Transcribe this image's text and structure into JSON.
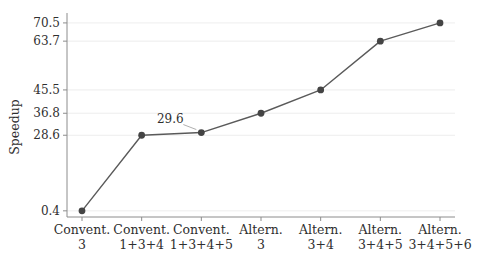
{
  "chart_data": {
    "type": "line",
    "title": "",
    "xlabel": "",
    "ylabel": "Speedup",
    "categories": [
      {
        "line1": "Convent.",
        "line2": "3"
      },
      {
        "line1": "Convent.",
        "line2": "1+3+4"
      },
      {
        "line1": "Convent.",
        "line2": "1+3+4+5"
      },
      {
        "line1": "Altern.",
        "line2": "3"
      },
      {
        "line1": "Altern.",
        "line2": "3+4"
      },
      {
        "line1": "Altern.",
        "line2": "3+4+5"
      },
      {
        "line1": "Altern.",
        "line2": "3+4+5+6"
      }
    ],
    "series": [
      {
        "name": "Speedup",
        "values": [
          0.4,
          28.6,
          29.6,
          36.8,
          45.5,
          63.7,
          70.5
        ]
      }
    ],
    "y_ticks": [
      0.4,
      28.6,
      36.8,
      45.5,
      63.7,
      70.5
    ],
    "y_tick_labels": [
      "0.4",
      "28.6",
      "36.8",
      "45.5",
      "63.7",
      "70.5"
    ],
    "ylim": [
      -1.9,
      74.2
    ],
    "grid": "horizontal",
    "legend_position": "none",
    "annotations": [
      {
        "text": "29.6",
        "point_index": 2
      }
    ],
    "colors": {
      "line": "#5a5a5a",
      "marker": "#444444",
      "grid": "#ebebeb",
      "axis": "#8c8c8c",
      "text": "#2f2f2f",
      "annotation_pointer": "#9a9a9a",
      "background": "#ffffff"
    }
  }
}
